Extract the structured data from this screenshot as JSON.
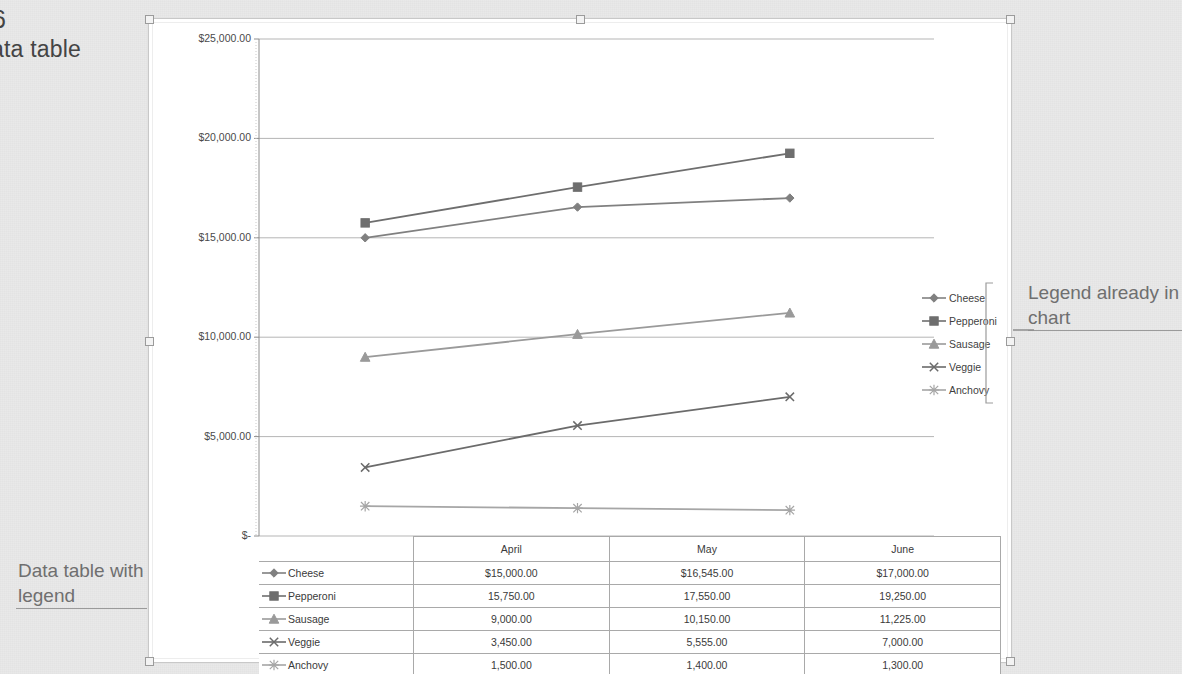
{
  "figure": {
    "caption_line1": "–6",
    "caption_line2": "data table"
  },
  "annotations": {
    "legend": "Legend already in chart",
    "data_table": "Data table with legend"
  },
  "chart_data": {
    "type": "line",
    "title": "",
    "xlabel": "",
    "ylabel": "",
    "categories": [
      "April",
      "May",
      "June"
    ],
    "ylim": [
      0,
      25000
    ],
    "ytick_values": [
      25000,
      20000,
      15000,
      10000,
      5000,
      0
    ],
    "ytick_labels": [
      "$25,000.00",
      "$20,000.00",
      "$15,000.00",
      "$10,000.00",
      "$5,000.00",
      "$-"
    ],
    "grid": true,
    "legend_position": "right",
    "series": [
      {
        "name": "Cheese",
        "marker": "diamond",
        "color": "#808080",
        "values": [
          15000,
          16545,
          17000
        ],
        "labels": [
          "$15,000.00",
          "$16,545.00",
          "$17,000.00"
        ]
      },
      {
        "name": "Pepperoni",
        "marker": "square",
        "color": "#6e6e6e",
        "values": [
          15750,
          17550,
          19250
        ],
        "labels": [
          "15,750.00",
          "17,550.00",
          "19,250.00"
        ]
      },
      {
        "name": "Sausage",
        "marker": "triangle",
        "color": "#9a9a9a",
        "values": [
          9000,
          10150,
          11225
        ],
        "labels": [
          "9,000.00",
          "10,150.00",
          "11,225.00"
        ]
      },
      {
        "name": "Veggie",
        "marker": "x",
        "color": "#6b6b6b",
        "values": [
          3450,
          5555,
          7000
        ],
        "labels": [
          "3,450.00",
          "5,555.00",
          "7,000.00"
        ]
      },
      {
        "name": "Anchovy",
        "marker": "star",
        "color": "#a6a6a6",
        "values": [
          1500,
          1400,
          1300
        ],
        "labels": [
          "1,500.00",
          "1,400.00",
          "1,300.00"
        ]
      }
    ]
  },
  "data_table": {
    "corner_label": "",
    "column_headers": [
      "April",
      "May",
      "June"
    ],
    "rows": [
      {
        "label": "Cheese",
        "cells": [
          "$15,000.00",
          "$16,545.00",
          "$17,000.00"
        ]
      },
      {
        "label": "Pepperoni",
        "cells": [
          "15,750.00",
          "17,550.00",
          "19,250.00"
        ]
      },
      {
        "label": "Sausage",
        "cells": [
          "9,000.00",
          "10,150.00",
          "11,225.00"
        ]
      },
      {
        "label": "Veggie",
        "cells": [
          "3,450.00",
          "5,555.00",
          "7,000.00"
        ]
      },
      {
        "label": "Anchovy",
        "cells": [
          "1,500.00",
          "1,400.00",
          "1,300.00"
        ]
      }
    ]
  },
  "colors": {
    "page_background": "#e9e9e9",
    "chart_background": "#ffffff",
    "gridline": "#b5b5b5",
    "annotation_text": "#6f6f6f"
  }
}
